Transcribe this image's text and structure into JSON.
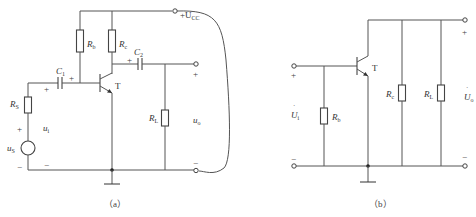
{
  "figure_a": {
    "caption": "（a）",
    "supply_label": "+U",
    "supply_sub": "CC",
    "transistor_label": "T",
    "components": {
      "Rb": {
        "main": "R",
        "sub": "b"
      },
      "Rc": {
        "main": "R",
        "sub": "c"
      },
      "C1": {
        "main": "C",
        "sub": "1"
      },
      "C2": {
        "main": "C",
        "sub": "2"
      },
      "RS": {
        "main": "R",
        "sub": "S"
      },
      "RL": {
        "main": "R",
        "sub": "L"
      },
      "uS": {
        "main": "u",
        "sub": "S"
      },
      "ui": {
        "main": "u",
        "sub": "i"
      },
      "uo": {
        "main": "u",
        "sub": "o"
      }
    },
    "signs": {
      "plus": "+",
      "minus": "−"
    }
  },
  "figure_b": {
    "caption": "（b）",
    "transistor_label": "T",
    "components": {
      "Rb": {
        "main": "R",
        "sub": "b"
      },
      "Rc": {
        "main": "R",
        "sub": "c"
      },
      "RL": {
        "main": "R",
        "sub": "L"
      },
      "Ui": {
        "main": "U",
        "sub": "i"
      },
      "Uo": {
        "main": "U",
        "sub": "o"
      }
    },
    "signs": {
      "plus": "+",
      "minus": "−"
    }
  }
}
